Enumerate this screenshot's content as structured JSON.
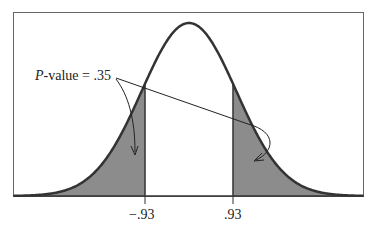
{
  "chart_data": {
    "type": "area",
    "title": "",
    "distribution": "standard normal",
    "xlabel": "",
    "ylabel": "",
    "tick_labels": [
      "-.93",
      ".93"
    ],
    "x_ticks": [
      -0.93,
      0.93
    ],
    "shaded_regions": [
      {
        "from": "-inf",
        "to": -0.93
      },
      {
        "from": 0.93,
        "to": "inf"
      }
    ],
    "annotation": {
      "prefix": "P",
      "text": "-value = .35",
      "value": 0.35
    },
    "grid": false,
    "legend": "none",
    "colors": {
      "fill": "#8c8c8c",
      "curve": "#333333",
      "frame": "#555555"
    }
  },
  "labels": {
    "p_prefix": "P",
    "p_rest": "-value = .35",
    "tick_left": "−.93",
    "tick_right": ".93"
  }
}
